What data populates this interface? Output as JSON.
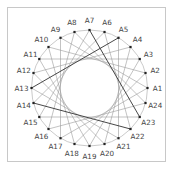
{
  "diagram": {
    "title": "",
    "point_count": 24,
    "point_prefix": "A",
    "labels": [
      "A1",
      "A2",
      "A3",
      "A4",
      "A5",
      "A6",
      "A7",
      "A8",
      "A9",
      "A10",
      "A11",
      "A12",
      "A13",
      "A14",
      "A15",
      "A16",
      "A17",
      "A18",
      "A19",
      "A20",
      "A21",
      "A22",
      "A23",
      "A24"
    ],
    "chord_skip": 8,
    "highlighted_chords": [
      [
        "A7",
        "A23"
      ],
      [
        "A5",
        "A13"
      ],
      [
        "A14",
        "A22"
      ]
    ],
    "colors": {
      "circle": "#bdbdbd",
      "chord": "#9a9a9a",
      "highlight": "#333333",
      "point": "#222222",
      "label": "#444444",
      "frame": "#c8c8c8"
    }
  }
}
